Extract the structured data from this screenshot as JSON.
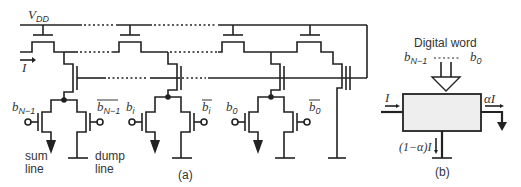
{
  "figure_a": {
    "supply_label": "V",
    "supply_sub": "DD",
    "input_current_label": "I",
    "columns": [
      {
        "bit_label": "b",
        "bit_sub": "N−1",
        "bitbar_label": "b",
        "bitbar_sub": "N−1"
      },
      {
        "bit_label": "b",
        "bit_sub": "i",
        "bitbar_label": "b",
        "bitbar_sub": "i"
      },
      {
        "bit_label": "b",
        "bit_sub": "0",
        "bitbar_label": "b",
        "bitbar_sub": "0"
      }
    ],
    "sum_line_label_1": "sum",
    "sum_line_label_2": "line",
    "dump_line_label_1": "dump",
    "dump_line_label_2": "line",
    "caption": "(a)"
  },
  "figure_b": {
    "title": "Digital word",
    "msb_label": "b",
    "msb_sub": "N−1",
    "lsb_label": "b",
    "lsb_sub": "0",
    "input_label": "I",
    "output_label": "αI",
    "dump_label": "(1−α)I",
    "caption": "(b)",
    "box_fill": "#eeeeee"
  }
}
